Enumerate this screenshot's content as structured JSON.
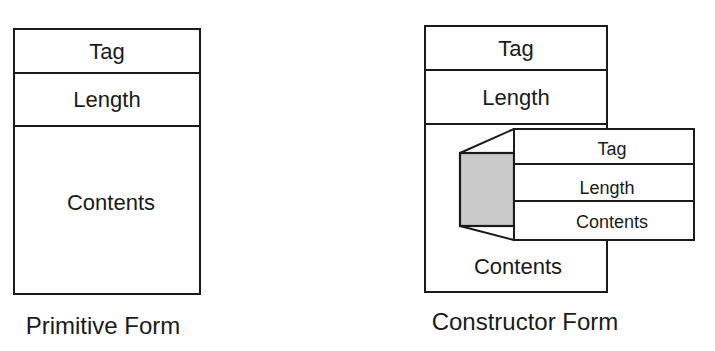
{
  "primitive": {
    "fields": [
      "Tag",
      "Length",
      "Contents"
    ],
    "caption": "Primitive Form"
  },
  "constructor": {
    "fields": [
      "Tag",
      "Length",
      "Contents"
    ],
    "nested": {
      "fields": [
        "Tag",
        "Length",
        "Contents"
      ]
    },
    "caption": "Constructor Form"
  },
  "colors": {
    "stroke": "#1a1a1a",
    "shade": "#c9c9c9",
    "background": "#ffffff"
  }
}
